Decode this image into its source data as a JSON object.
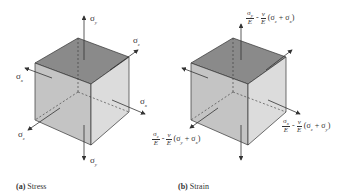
{
  "figure": {
    "panels": [
      {
        "id": "a",
        "caption_letter": "(a)",
        "caption_text": "Stress",
        "labels": {
          "top": "σ_y",
          "bottom": "σ_y",
          "right_back": "σ_z",
          "left_front": "σ_z",
          "left": "σ_x",
          "right": "σ_x"
        }
      },
      {
        "id": "b",
        "caption_letter": "(b)",
        "caption_text": "Strain",
        "equations": {
          "top": {
            "num": "σy",
            "den": "E",
            "minus": "-",
            "nu": "ν",
            "nu_den": "E",
            "sum": "(σz + σx)"
          },
          "right": {
            "num": "σx",
            "den": "E",
            "minus": "-",
            "nu": "ν",
            "nu_den": "E",
            "sum": "(σz + σy)"
          },
          "left": {
            "num": "σz",
            "den": "E",
            "minus": "-",
            "nu": "ν",
            "nu_den": "E",
            "sum": "(σy + σx)"
          }
        }
      }
    ],
    "colors": {
      "top_face": "#8a8a8a",
      "front_face": "#c4c4c4",
      "side_face": "#dcdcdc",
      "edge": "#333333",
      "arrow": "#333333"
    }
  }
}
